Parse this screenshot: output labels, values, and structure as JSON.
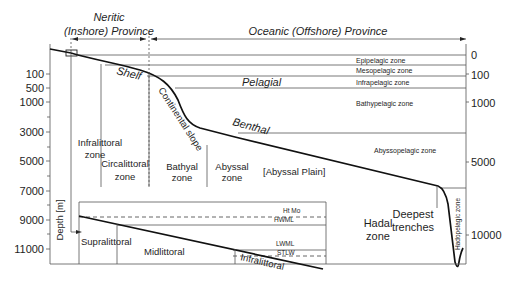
{
  "provinces": {
    "neritic_line1": "Neritic",
    "neritic_line2": "(Inshore) Province",
    "oceanic": "Oceanic (Offshore) Province"
  },
  "left_axis": {
    "title": "Depth [m]",
    "ticks": [
      "100",
      "500",
      "1000",
      "3000",
      "5000",
      "7000",
      "9000",
      "11000"
    ]
  },
  "right_axis": {
    "ticks": [
      "0",
      "100",
      "1000",
      "5000",
      "10000"
    ]
  },
  "pelagic_zones": {
    "epipelagic": "Epipelagic zone",
    "mesopelagic": "Mesopelagic zone",
    "infrapelagic": "Infrapelagic zone",
    "bathypelagic": "Bathypelagic zone",
    "abyssopelagic": "Abyssopelagic zone",
    "hadopelagic": "Hadopelagic zone"
  },
  "realms": {
    "pelagial": "Pelagial",
    "benthal": "Benthal"
  },
  "seafloor": {
    "shelf": "Shelf",
    "continental_slope": "Continental slope",
    "abyssal_plain": "[Abyssal Plain]",
    "deepest_trenches_1": "Deepest",
    "deepest_trenches_2": "trenches"
  },
  "benthic_zones": {
    "infralittoral_1": "Infralittoral",
    "infralittoral_2": "zone",
    "circalittoral_1": "Circalittoral",
    "circalittoral_2": "zone",
    "bathyal_1": "Bathyal",
    "bathyal_2": "zone",
    "abyssal_1": "Abyssal",
    "abyssal_2": "zone",
    "hadal_1": "Hadal",
    "hadal_2": "zone"
  },
  "inset": {
    "supralittoral": "Supralittoral",
    "midlittoral": "Midlittoral",
    "infralittoral": "Infralittoral",
    "ht_mo": "Ht Mo",
    "hwml": "HWML",
    "lwml": "LWML",
    "stlw": "STLW"
  }
}
